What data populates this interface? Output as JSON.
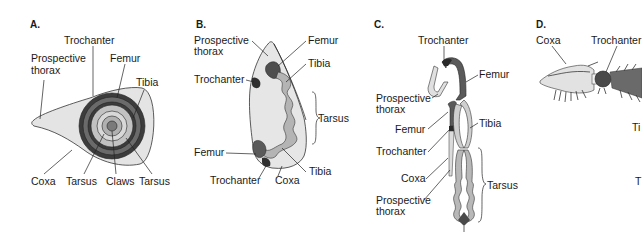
{
  "figure": {
    "panels": [
      {
        "id": "A",
        "label": "A.",
        "parts": {
          "trochanter": "Trochanter",
          "prospective_thorax_1": "Prospective",
          "prospective_thorax_2": "thorax",
          "femur": "Femur",
          "tibia": "Tibia",
          "coxa": "Coxa",
          "tarsus_inner": "Tarsus",
          "claws": "Claws",
          "tarsus_outer": "Tarsus"
        }
      },
      {
        "id": "B",
        "label": "B.",
        "parts": {
          "prospective_thorax_1": "Prospective",
          "prospective_thorax_2": "thorax",
          "femur_top": "Femur",
          "tibia_top": "Tibia",
          "trochanter_top": "Trochanter",
          "tarsus": "Tarsus",
          "femur_bottom": "Femur",
          "tibia_bottom": "Tibia",
          "trochanter_bottom": "Trochanter",
          "coxa": "Coxa"
        }
      },
      {
        "id": "C",
        "label": "C.",
        "parts": {
          "trochanter_top": "Trochanter",
          "femur_top": "Femur",
          "prospective_thorax_top_1": "Prospective",
          "prospective_thorax_top_2": "thorax",
          "femur_left": "Femur",
          "tibia": "Tibia",
          "trochanter_left": "Trochanter",
          "coxa": "Coxa",
          "tarsus": "Tarsus",
          "prospective_thorax_bottom_1": "Prospective",
          "prospective_thorax_bottom_2": "thorax"
        }
      },
      {
        "id": "D",
        "label": "D.",
        "parts": {
          "coxa": "Coxa",
          "trochanter": "Trochanter",
          "tibia_partial": "Ti",
          "tarsus_partial": "T"
        }
      }
    ],
    "colors": {
      "light": "#e4e4e4",
      "mid_light": "#c2c2c2",
      "mid": "#9a9a9a",
      "dark": "#5e5e5e",
      "darkest": "#3c3c3c",
      "outline": "#333333"
    }
  }
}
